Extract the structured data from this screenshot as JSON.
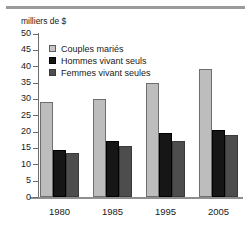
{
  "chart_data": {
    "type": "bar",
    "title": "",
    "subtitle": "",
    "ylabel": "milliers de $",
    "xlabel": "",
    "categories": [
      "1980",
      "1985",
      "1995",
      "2005"
    ],
    "series": [
      {
        "name": "Couples mariés",
        "values": [
          29,
          30,
          35,
          39
        ],
        "color": "#bdbdbd"
      },
      {
        "name": "Hommes vivant seuls",
        "values": [
          14.5,
          17,
          19.5,
          20.5
        ],
        "color": "#161616"
      },
      {
        "name": "Femmes vivant seules",
        "values": [
          13.5,
          15.5,
          17,
          19
        ],
        "color": "#4d4d4d"
      }
    ],
    "ylim": [
      0,
      50
    ],
    "yticks": [
      0,
      5,
      10,
      15,
      20,
      25,
      30,
      35,
      40,
      45,
      50
    ],
    "ytick_labels": [
      "0",
      "5",
      "10",
      "15",
      "20",
      "25",
      "30",
      "35",
      "40",
      "45",
      "50"
    ],
    "grid": false,
    "legend_position": "upper-left",
    "legend_entries": [
      "Couples mariés",
      "Hommes vivant seuls",
      "Femmes vivant seules"
    ]
  }
}
